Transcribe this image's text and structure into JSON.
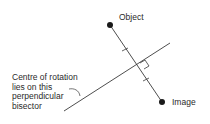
{
  "diagram": {
    "type": "geometry-rotation-construction",
    "labels": {
      "object": "Object",
      "image": "Image",
      "annotation_lines": [
        "Centre of rotation",
        "lies on this",
        "perpendicular",
        "bisector"
      ]
    },
    "points": {
      "object": {
        "x": 110,
        "y": 25
      },
      "image": {
        "x": 162,
        "y": 102
      }
    },
    "segment_object_image": {
      "x1": 110,
      "y1": 25,
      "x2": 162,
      "y2": 102
    },
    "perpendicular_bisector": {
      "x1": 64,
      "y1": 111,
      "x2": 170,
      "y2": 43
    },
    "colors": {
      "line": "#3a3a3a",
      "point": "#1a1a1a",
      "text": "#2a2a2a",
      "background": "#ffffff"
    }
  }
}
